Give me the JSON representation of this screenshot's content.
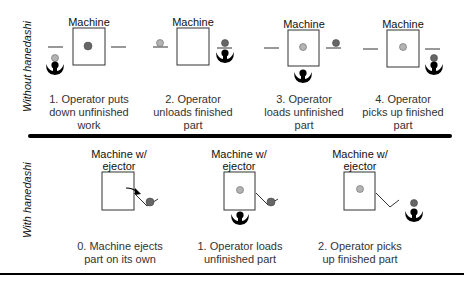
{
  "colors": {
    "finished_part": "#666666",
    "unfinished_part": "#b3b3b3",
    "operator": "#000000",
    "line": "#333333"
  },
  "sections": {
    "without": {
      "label": "Without hanedashi",
      "steps": [
        {
          "machine_label": "Machine",
          "caption_lines": [
            "1. Operator puts",
            "down unfinished",
            "work"
          ]
        },
        {
          "machine_label": "Machine",
          "caption_lines": [
            "2. Operator",
            "unloads finished",
            "part"
          ]
        },
        {
          "machine_label": "Machine",
          "caption_lines": [
            "3. Operator",
            "loads unfinished",
            "part"
          ]
        },
        {
          "machine_label": "Machine",
          "caption_lines": [
            "4. Operator",
            "picks up finished",
            "part"
          ]
        }
      ]
    },
    "with": {
      "label": "With hanedashi",
      "steps": [
        {
          "machine_label_1": "Machine w/",
          "machine_label_2": "ejector",
          "caption_lines": [
            "0. Machine ejects",
            "part on its own"
          ]
        },
        {
          "machine_label_1": "Machine w/",
          "machine_label_2": "ejector",
          "caption_lines": [
            "1. Operator loads",
            "unfinished part"
          ]
        },
        {
          "machine_label_1": "Machine w/",
          "machine_label_2": "ejector",
          "caption_lines": [
            "2. Operator picks",
            "up finished part"
          ]
        }
      ]
    }
  }
}
